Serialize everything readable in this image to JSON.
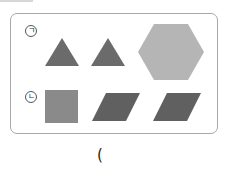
{
  "rows": [
    {
      "label": "ㄱ",
      "shapes": [
        {
          "type": "triangle",
          "color": "#6b6b6b"
        },
        {
          "type": "triangle",
          "color": "#6b6b6b"
        },
        {
          "type": "hexagon",
          "color": "#b5b5b5"
        }
      ]
    },
    {
      "label": "ㄴ",
      "shapes": [
        {
          "type": "square",
          "color": "#8a8a8a"
        },
        {
          "type": "parallelogram",
          "color": "#606060"
        },
        {
          "type": "parallelogram",
          "color": "#606060"
        }
      ]
    }
  ],
  "answer": {
    "open_paren": "("
  }
}
